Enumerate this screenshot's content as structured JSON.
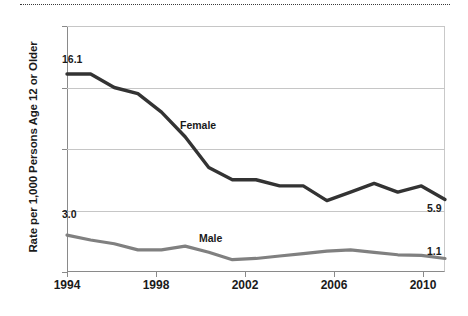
{
  "figure": {
    "decoration": {
      "top_rule": "dotted-rule"
    }
  },
  "axes": {
    "ylabel": "Rate per 1,000 Persons Age 12 or Older",
    "xlabel": "",
    "y_ticks": [
      "0",
      "5",
      "10",
      "15",
      "20"
    ],
    "x_ticks": [
      "1994",
      "1998",
      "2002",
      "2006",
      "2010"
    ]
  },
  "annotations": {
    "female_series_label": "Female",
    "male_series_label": "Male",
    "female_start_value": "16.1",
    "female_end_value": "5.9",
    "male_start_value": "3.0",
    "male_end_value": "1.1"
  },
  "colors": {
    "female_line": "#333333",
    "male_line": "#808080",
    "grid": "#c6c6c6",
    "axis": "#8a8a8a",
    "text": "#1a1a1a"
  },
  "chart_data": {
    "type": "line",
    "title": "",
    "xlabel": "",
    "ylabel": "Rate per 1,000 Persons Age 12 or Older",
    "xlim": [
      1994,
      2010
    ],
    "ylim": [
      0,
      20
    ],
    "yticks": [
      0,
      5,
      10,
      15,
      20
    ],
    "xticks": [
      1994,
      1998,
      2002,
      2006,
      2010
    ],
    "grid": "horizontal",
    "legend": "inline-labels",
    "x": [
      1994,
      1995,
      1996,
      1997,
      1998,
      1999,
      2000,
      2001,
      2002,
      2003,
      2004,
      2005,
      2006,
      2007,
      2008,
      2009,
      2010
    ],
    "series": [
      {
        "name": "Female",
        "color": "#333333",
        "values": [
          16.1,
          16.1,
          15.0,
          14.5,
          13.0,
          11.0,
          8.5,
          7.5,
          7.5,
          7.0,
          7.0,
          5.8,
          6.5,
          7.2,
          6.5,
          7.0,
          5.9
        ],
        "endpoint_labels": {
          "first": "16.1",
          "last": "5.9"
        }
      },
      {
        "name": "Male",
        "color": "#808080",
        "values": [
          3.0,
          2.6,
          2.3,
          1.8,
          1.8,
          2.1,
          1.6,
          1.0,
          1.1,
          1.3,
          1.5,
          1.7,
          1.8,
          1.6,
          1.4,
          1.35,
          1.1
        ],
        "endpoint_labels": {
          "first": "3.0",
          "last": "1.1"
        }
      }
    ]
  }
}
